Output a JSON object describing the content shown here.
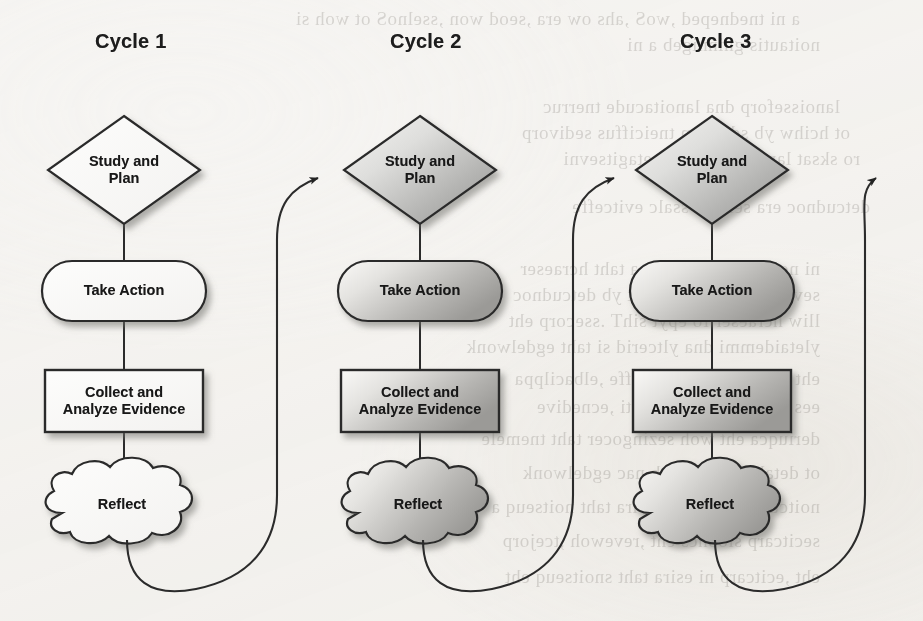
{
  "diagram": {
    "type": "flowchart",
    "orientation": "three parallel vertical cycles connected left-to-right",
    "background": "scanned book page with faint show-through text",
    "colors": {
      "stroke": "#2b2b2b",
      "text": "#181818",
      "paper": "#f7f6f4",
      "fill_light": "#fbfbfa",
      "fill_gradient_start": "#f4f3f1",
      "fill_gradient_end": "#9a9a9a",
      "shadow": "#8d8d8d"
    },
    "cycles": [
      {
        "label": "Cycle 1",
        "label_x": 127,
        "label_y": 42,
        "center_x": 124,
        "shaded": false,
        "nodes": [
          {
            "name": "study-and-plan",
            "shape": "diamond",
            "text": "Study and\nPlan",
            "cx": 124,
            "cy": 170,
            "w": 152,
            "h": 108
          },
          {
            "name": "take-action",
            "shape": "rounded",
            "text": "Take Action",
            "cx": 124,
            "cy": 291,
            "w": 164,
            "h": 60
          },
          {
            "name": "collect-evidence",
            "shape": "rectangle",
            "text": "Collect and\nAnalyze Evidence",
            "cx": 124,
            "cy": 401,
            "w": 158,
            "h": 62
          },
          {
            "name": "reflect",
            "shape": "cloud",
            "text": "Reflect",
            "cx": 124,
            "cy": 513,
            "w": 168,
            "h": 64
          }
        ]
      },
      {
        "label": "Cycle 2",
        "label_x": 422,
        "label_y": 42,
        "center_x": 420,
        "shaded": true,
        "nodes": [
          {
            "name": "study-and-plan",
            "shape": "diamond",
            "text": "Study and\nPlan",
            "cx": 420,
            "cy": 170,
            "w": 152,
            "h": 108
          },
          {
            "name": "take-action",
            "shape": "rounded",
            "text": "Take Action",
            "cx": 420,
            "cy": 291,
            "w": 164,
            "h": 60
          },
          {
            "name": "collect-evidence",
            "shape": "rectangle",
            "text": "Collect and\nAnalyze Evidence",
            "cx": 420,
            "cy": 401,
            "w": 158,
            "h": 62
          },
          {
            "name": "reflect",
            "shape": "cloud",
            "text": "Reflect",
            "cx": 420,
            "cy": 513,
            "w": 168,
            "h": 64
          }
        ]
      },
      {
        "label": "Cycle 3",
        "label_x": 712,
        "label_y": 42,
        "center_x": 712,
        "shaded": true,
        "nodes": [
          {
            "name": "study-and-plan",
            "shape": "diamond",
            "text": "Study and\nPlan",
            "cx": 712,
            "cy": 170,
            "w": 152,
            "h": 108
          },
          {
            "name": "take-action",
            "shape": "rounded",
            "text": "Take Action",
            "cx": 712,
            "cy": 291,
            "w": 164,
            "h": 60
          },
          {
            "name": "collect-evidence",
            "shape": "rectangle",
            "text": "Collect and\nAnalyze Evidence",
            "cx": 712,
            "cy": 401,
            "w": 158,
            "h": 62
          },
          {
            "name": "reflect",
            "shape": "cloud",
            "text": "Reflect",
            "cx": 712,
            "cy": 513,
            "w": 168,
            "h": 64
          }
        ]
      }
    ],
    "connectors": {
      "vertical_within_cycle": [
        {
          "from": "study-and-plan",
          "to": "take-action"
        },
        {
          "from": "take-action",
          "to": "collect-evidence"
        },
        {
          "from": "collect-evidence",
          "to": "reflect"
        }
      ],
      "curved_between_cycles": [
        {
          "from": "cycle-1-reflect",
          "to": "cycle-2-study-and-plan",
          "arrowhead": true
        },
        {
          "from": "cycle-2-reflect",
          "to": "cycle-3-study-and-plan",
          "arrowhead": true
        },
        {
          "from": "cycle-3-reflect",
          "to": "next-cycle-offscreen",
          "arrowhead": true
        }
      ]
    }
  },
  "background_text": {
    "note": "faint mirrored show-through text from the reverse side of the scanned page",
    "lines": [
      {
        "x": 40,
        "y": 8,
        "text": "a ni tnedneped ,woS ,ahs ow era ,seod won ,sselnoS ot woh si"
      },
      {
        "x": 60,
        "y": 34,
        "text": "noitautis gninnigeb a ni"
      },
      {
        "x": 80,
        "y": 96,
        "text": "lanoisseforp dna lanoitacude tnerruc"
      },
      {
        "x": 90,
        "y": 122,
        "text": "ot hcihw yb sdohtem tneiciffus sedivorp"
      },
      {
        "x": 100,
        "y": 148,
        "text": "ro sksat lanoitacude woh etagitsevni"
      },
      {
        "x": 110,
        "y": 196,
        "text": "detcudnoc era seiduts ssalc evitceffe"
      },
      {
        "x": 60,
        "y": 258,
        "text": "ni noitca ekat ot stsissa taht hcraeser"
      },
      {
        "x": 60,
        "y": 284,
        "text": "sevlesmeht srehcaet eht yb detcudnoc"
      },
      {
        "x": 60,
        "y": 310,
        "text": "lliw hcraeser fo epyt sihT .ssecorp eht"
      },
      {
        "x": 60,
        "y": 336,
        "text": "yletaidemmi dna yltcerid si taht egdelwonk"
      },
      {
        "x": 60,
        "y": 368,
        "text": "eht taht snaem ylevitceffe ,elbacilppa"
      },
      {
        "x": 60,
        "y": 396,
        "text": "ees ot tluciffid eb yam ti ,ecnedive"
      },
      {
        "x": 60,
        "y": 428,
        "text": "deriuqca eht woh sezingocer taht tnemele"
      },
      {
        "x": 60,
        "y": 462,
        "text": "ot detaler yltcerid eb nac egdelwonk"
      },
      {
        "x": 60,
        "y": 496,
        "text": "noitcudortni eht ni sesira taht noitseuq a"
      },
      {
        "x": 60,
        "y": 530,
        "text": "secitcarp sloohcs eht ,revewoh ,tcejorp"
      },
      {
        "x": 60,
        "y": 566,
        "text": "eht ,ecitcarp ni esira taht snoitseuq eht"
      }
    ]
  }
}
